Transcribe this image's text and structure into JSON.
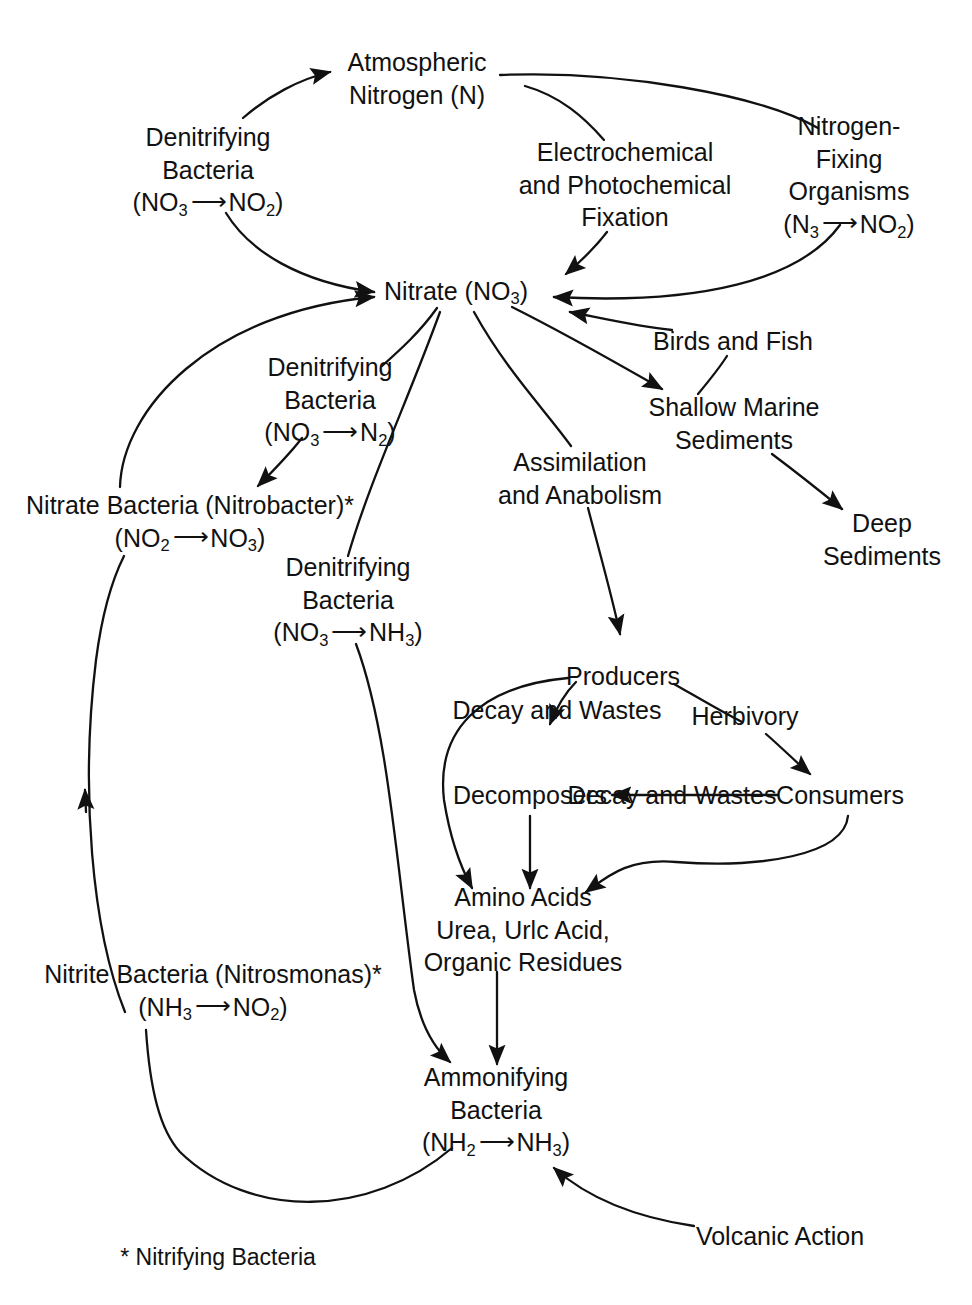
{
  "diagram": {
    "background_color": "#ffffff",
    "ink_color": "#111111",
    "nodes": [
      {
        "id": "atmospheric-nitrogen",
        "lines": [
          "Atmospheric",
          "Nitrogen (N)"
        ],
        "x": 417,
        "y": 78
      },
      {
        "id": "denitrifying-bacteria-no3-no2",
        "lines": [
          "Denitrifying",
          "Bacteria",
          "(NO3 → NO2)"
        ],
        "x": 208,
        "y": 170
      },
      {
        "id": "electrochemical-photochemical-fixation",
        "lines": [
          "Electrochemical",
          "and Photochemical",
          "Fixation"
        ],
        "x": 625,
        "y": 185
      },
      {
        "id": "nitrogen-fixing-organisms",
        "lines": [
          "Nitrogen-",
          "Fixing",
          "Organisms",
          "(N3 → NO2)"
        ],
        "x": 849,
        "y": 175
      },
      {
        "id": "nitrate",
        "lines": [
          "Nitrate (NO3)"
        ],
        "x": 456,
        "y": 291
      },
      {
        "id": "denitrifying-bacteria-no3-n2",
        "lines": [
          "Denitrifying",
          "Bacteria",
          "(NO3 → N2)"
        ],
        "x": 330,
        "y": 400
      },
      {
        "id": "birds-and-fish",
        "lines": [
          "Birds and Fish"
        ],
        "x": 733,
        "y": 341
      },
      {
        "id": "shallow-marine-sediments",
        "lines": [
          "Shallow Marine",
          "Sediments"
        ],
        "x": 734,
        "y": 423
      },
      {
        "id": "assimilation-and-anabolism",
        "lines": [
          "Assimilation",
          "and Anabolism"
        ],
        "x": 580,
        "y": 478
      },
      {
        "id": "deep-sediments",
        "lines": [
          "Deep",
          "Sediments"
        ],
        "x": 882,
        "y": 539
      },
      {
        "id": "nitrate-bacteria-nitrobacter",
        "lines": [
          "Nitrate Bacteria (Nitrobacter)*",
          "(NO2 → NO3)"
        ],
        "x": 190,
        "y": 521
      },
      {
        "id": "denitrifying-bacteria-no3-nh3",
        "lines": [
          "Denitrifying",
          "Bacteria",
          "(NO3 → NH3)"
        ],
        "x": 348,
        "y": 600
      },
      {
        "id": "producers",
        "lines": [
          "Producers"
        ],
        "x": 623,
        "y": 676
      },
      {
        "id": "decomposers",
        "lines": [
          "Decomposers"
        ],
        "x": 530,
        "y": 795
      },
      {
        "id": "consumers",
        "lines": [
          "Consumers"
        ],
        "x": 840,
        "y": 795
      },
      {
        "id": "amino-acids",
        "lines": [
          "Amino Acids",
          "Urea, Urlc Acid,",
          "Organic Residues"
        ],
        "x": 523,
        "y": 930
      },
      {
        "id": "nitrite-bacteria-nitrosmonas",
        "lines": [
          "Nitrite Bacteria (Nitrosmonas)*",
          "(NH3 → NO2)"
        ],
        "x": 213,
        "y": 990
      },
      {
        "id": "ammonifying-bacteria",
        "lines": [
          "Ammonifying",
          "Bacteria",
          "(NH2 → NH3)"
        ],
        "x": 496,
        "y": 1110
      },
      {
        "id": "volcanic-action",
        "lines": [
          "Volcanic Action"
        ],
        "x": 780,
        "y": 1236
      }
    ],
    "edge_labels": [
      {
        "id": "decay-and-wastes-producers",
        "lines": [
          "Decay and",
          "Wastes"
        ],
        "x": 557,
        "y": 710
      },
      {
        "id": "herbivory",
        "lines": [
          "Herbivory"
        ],
        "x": 745,
        "y": 716
      },
      {
        "id": "decay-and-wastes-consumers",
        "lines": [
          "Decay and",
          "Wastes"
        ],
        "x": 672,
        "y": 795
      }
    ],
    "footnote": {
      "id": "nitrifying-bacteria-footnote",
      "text": "* Nitrifying Bacteria",
      "x": 218,
      "y": 1257
    },
    "edges": [
      {
        "from": "denitrifying-bacteria-no3-no2",
        "to": "atmospheric-nitrogen"
      },
      {
        "from": "denitrifying-bacteria-no3-no2",
        "to": "nitrate"
      },
      {
        "from": "atmospheric-nitrogen",
        "to": "electrochemical-photochemical-fixation"
      },
      {
        "from": "atmospheric-nitrogen",
        "to": "nitrogen-fixing-organisms"
      },
      {
        "from": "electrochemical-photochemical-fixation",
        "to": "nitrate"
      },
      {
        "from": "nitrogen-fixing-organisms",
        "to": "nitrate"
      },
      {
        "from": "birds-and-fish",
        "to": "nitrate"
      },
      {
        "from": "nitrate",
        "to": "denitrifying-bacteria-no3-n2"
      },
      {
        "from": "denitrifying-bacteria-no3-n2",
        "to": "nitrate-bacteria-nitrobacter"
      },
      {
        "from": "nitrate-bacteria-nitrobacter",
        "to": "nitrate"
      },
      {
        "from": "nitrate",
        "to": "denitrifying-bacteria-no3-nh3"
      },
      {
        "from": "nitrate",
        "to": "assimilation-and-anabolism"
      },
      {
        "from": "nitrate",
        "to": "shallow-marine-sediments"
      },
      {
        "from": "birds-and-fish",
        "to": "shallow-marine-sediments"
      },
      {
        "from": "shallow-marine-sediments",
        "to": "deep-sediments"
      },
      {
        "from": "assimilation-and-anabolism",
        "to": "producers"
      },
      {
        "from": "producers",
        "to": "decomposers"
      },
      {
        "from": "producers",
        "to": "consumers"
      },
      {
        "from": "consumers",
        "to": "decomposers"
      },
      {
        "from": "producers",
        "to": "amino-acids"
      },
      {
        "from": "decomposers",
        "to": "amino-acids"
      },
      {
        "from": "consumers",
        "to": "amino-acids"
      },
      {
        "from": "amino-acids",
        "to": "ammonifying-bacteria"
      },
      {
        "from": "denitrifying-bacteria-no3-nh3",
        "to": "ammonifying-bacteria"
      },
      {
        "from": "volcanic-action",
        "to": "ammonifying-bacteria"
      },
      {
        "from": "ammonifying-bacteria",
        "to": "nitrite-bacteria-nitrosmonas"
      },
      {
        "from": "nitrite-bacteria-nitrosmonas",
        "to": "nitrate-bacteria-nitrobacter"
      }
    ]
  }
}
